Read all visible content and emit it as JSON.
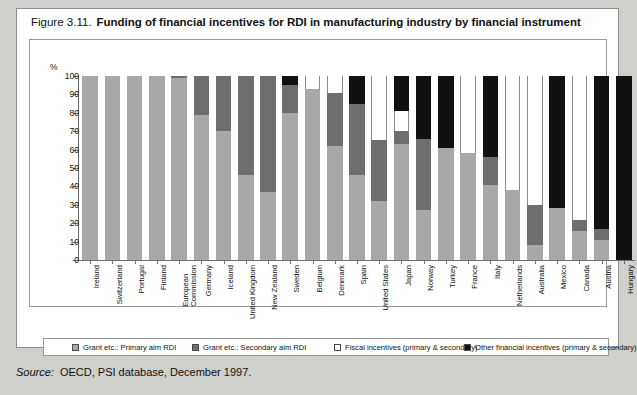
{
  "figure": {
    "number": "Figure 3.11.",
    "title": "Funding of financial incentives for RDI in manufacturing industry by financial instrument"
  },
  "source": {
    "label": "Source:",
    "text": "OECD, PSI database, December 1997."
  },
  "axis": {
    "unit_label": "%",
    "ticks": [
      "100",
      "90",
      "80",
      "70",
      "60",
      "50",
      "40",
      "30",
      "20",
      "10",
      "0"
    ]
  },
  "legend": {
    "items": [
      {
        "label": "Grant etc.:  Primary aim RDI",
        "swatch": "primary-swatch",
        "color": "#a8a8a8"
      },
      {
        "label": "Grant etc.:  Secondary aim RDI",
        "swatch": "secondary-swatch",
        "color": "#6e6e6e"
      },
      {
        "label": "Fiscal incentives (primary & secondary)",
        "swatch": "fiscal-swatch",
        "color": "#ffffff"
      },
      {
        "label": "Other financial incentives (primary & secondary)",
        "swatch": "other-swatch",
        "color": "#111111"
      }
    ]
  },
  "chart_data": {
    "type": "bar",
    "subtype": "stacked-100-percent",
    "title": "Funding of financial incentives for RDI in manufacturing industry by financial instrument",
    "xlabel": "",
    "ylabel": "%",
    "ylim": [
      0,
      100
    ],
    "ytick_step": 10,
    "grid": false,
    "legend_position": "bottom",
    "categories": [
      "Ireland",
      "Switzerland",
      "Portugal",
      "Finland",
      "European\nCommission",
      "Germany",
      "Iceland",
      "United Kingdom",
      "New Zealand",
      "Sweden",
      "Belgium",
      "Denmark",
      "Spain",
      "United States",
      "Japan",
      "Norway",
      "Turkey",
      "France",
      "Italy",
      "Netherlands",
      "Australia",
      "Mexico",
      "Canada",
      "Austria",
      "Hungary"
    ],
    "series": [
      {
        "name": "Grant etc.:  Primary aim RDI",
        "color": "#a8a8a8",
        "values": [
          100,
          100,
          100,
          100,
          99,
          79,
          70,
          46,
          37,
          80,
          93,
          62,
          46,
          32,
          63,
          27,
          61,
          58,
          41,
          38,
          8,
          28,
          16,
          11,
          0
        ]
      },
      {
        "name": "Grant etc.:  Secondary aim RDI",
        "color": "#6e6e6e",
        "values": [
          0,
          0,
          0,
          0,
          1,
          21,
          30,
          54,
          63,
          15,
          0,
          29,
          39,
          33,
          7,
          39,
          0,
          0,
          15,
          0,
          22,
          0,
          6,
          6,
          0
        ]
      },
      {
        "name": "Fiscal incentives (primary & secondary)",
        "color": "#ffffff",
        "values": [
          0,
          0,
          0,
          0,
          0,
          0,
          0,
          0,
          0,
          0,
          7,
          9,
          0,
          35,
          11,
          0,
          0,
          42,
          0,
          62,
          70,
          0,
          78,
          0,
          0
        ]
      },
      {
        "name": "Other financial incentives (primary & secondary)",
        "color": "#111111",
        "values": [
          0,
          0,
          0,
          0,
          0,
          0,
          0,
          0,
          0,
          5,
          0,
          0,
          15,
          0,
          19,
          34,
          39,
          0,
          44,
          0,
          0,
          72,
          0,
          83,
          100
        ]
      }
    ]
  }
}
